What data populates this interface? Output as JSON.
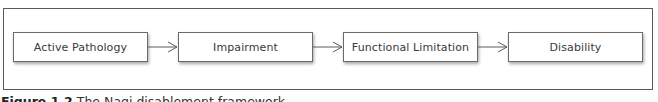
{
  "diagram": {
    "type": "flowchart",
    "direction": "left-to-right",
    "nodes": [
      {
        "id": "n1",
        "label": "Active Pathology"
      },
      {
        "id": "n2",
        "label": "Impairment"
      },
      {
        "id": "n3",
        "label": "Functional Limitation"
      },
      {
        "id": "n4",
        "label": "Disability"
      }
    ],
    "edges": [
      {
        "from": "n1",
        "to": "n2",
        "icon": "arrow-right-icon"
      },
      {
        "from": "n2",
        "to": "n3",
        "icon": "arrow-right-icon"
      },
      {
        "from": "n3",
        "to": "n4",
        "icon": "arrow-right-icon"
      }
    ],
    "colors": {
      "border": "#6a6a6a",
      "frame": "#5a5a5a",
      "text": "#3a3a3a"
    }
  },
  "caption": {
    "figure_label": "Figure 1.2",
    "text": "The Nagi disablement framework"
  }
}
